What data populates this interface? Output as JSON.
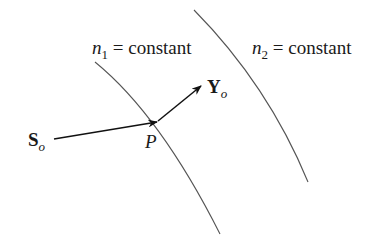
{
  "diagram": {
    "surfaces": [
      {
        "id": "n1",
        "label_var": "n",
        "label_sub": "1",
        "label_rest": " = constant"
      },
      {
        "id": "n2",
        "label_var": "n",
        "label_sub": "2",
        "label_rest": " = constant"
      }
    ],
    "vectors": {
      "incident": {
        "var": "S",
        "sub": "o"
      },
      "outgoing": {
        "var": "Y",
        "sub": "o"
      }
    },
    "point": {
      "label": "P"
    },
    "colors": {
      "line": "#555555",
      "arrow": "#111111",
      "text": "#1a1a1a"
    }
  }
}
